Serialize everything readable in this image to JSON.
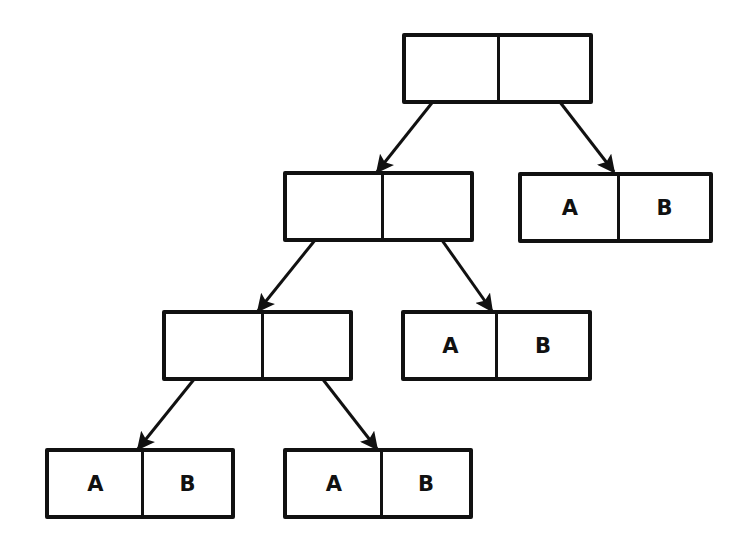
{
  "diagram": {
    "type": "cons-cell tree (box-and-pointer)",
    "colors": {
      "line": "#111111",
      "background": "#ffffff"
    },
    "cells": [
      {
        "id": "root",
        "x": 402,
        "y": 33,
        "w": 191,
        "h": 71,
        "div": 92,
        "car": "",
        "cdr": ""
      },
      {
        "id": "n1",
        "x": 283,
        "y": 171,
        "w": 191,
        "h": 71,
        "div": 95,
        "car": "",
        "cdr": ""
      },
      {
        "id": "leaf1",
        "x": 518,
        "y": 172,
        "w": 195,
        "h": 71,
        "div": 96,
        "car": "A",
        "cdr": "B"
      },
      {
        "id": "n2",
        "x": 162,
        "y": 310,
        "w": 191,
        "h": 71,
        "div": 96,
        "car": "",
        "cdr": ""
      },
      {
        "id": "leaf2",
        "x": 401,
        "y": 310,
        "w": 191,
        "h": 71,
        "div": 91,
        "car": "A",
        "cdr": "B"
      },
      {
        "id": "leaf3",
        "x": 45,
        "y": 448,
        "w": 190,
        "h": 71,
        "div": 93,
        "car": "A",
        "cdr": "B"
      },
      {
        "id": "leaf4",
        "x": 283,
        "y": 448,
        "w": 190,
        "h": 71,
        "div": 94,
        "car": "A",
        "cdr": "B"
      }
    ],
    "arrows": [
      {
        "from": "root.car",
        "to": "n1",
        "x1": 447,
        "y1": 84,
        "x2": 377,
        "y2": 172
      },
      {
        "from": "root.cdr",
        "to": "leaf1",
        "x1": 546,
        "y1": 84,
        "x2": 614,
        "y2": 172
      },
      {
        "from": "n1.car",
        "to": "n2",
        "x1": 328,
        "y1": 224,
        "x2": 258,
        "y2": 311
      },
      {
        "from": "n1.cdr",
        "to": "leaf2",
        "x1": 427,
        "y1": 219,
        "x2": 492,
        "y2": 311
      },
      {
        "from": "n2.car",
        "to": "leaf3",
        "x1": 208,
        "y1": 362,
        "x2": 138,
        "y2": 449
      },
      {
        "from": "n2.cdr",
        "to": "leaf4",
        "x1": 307,
        "y1": 359,
        "x2": 377,
        "y2": 449
      }
    ]
  }
}
